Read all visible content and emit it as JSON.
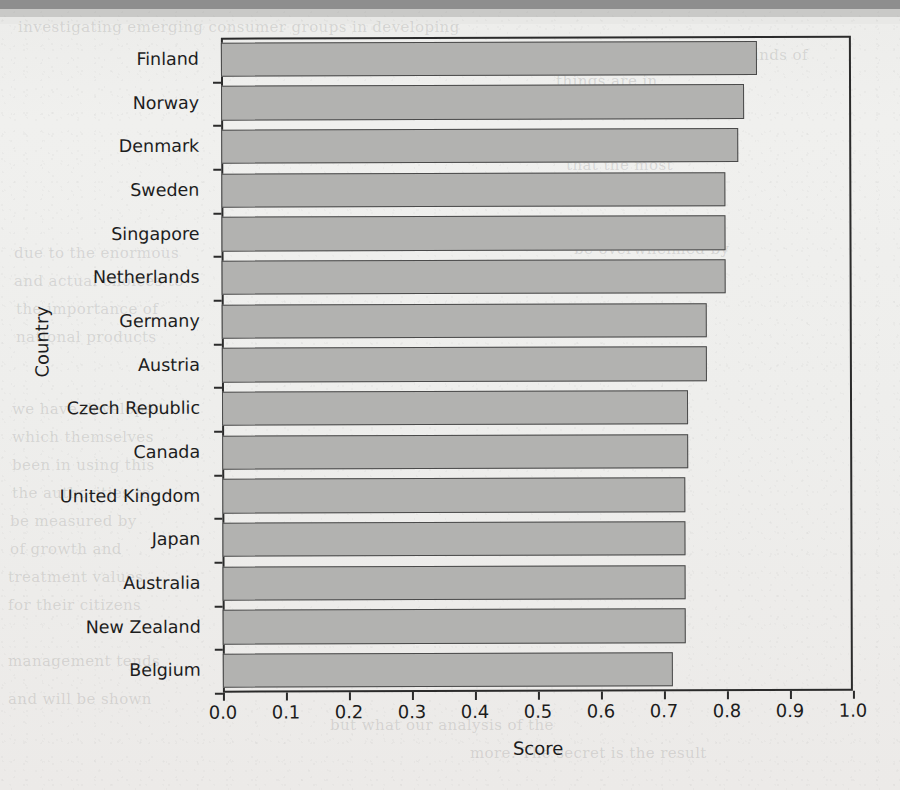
{
  "page": {
    "media": "scanned-book-page",
    "figure_type": "horizontal-bar-chart"
  },
  "chart_data": {
    "type": "bar",
    "orientation": "horizontal",
    "title": "",
    "xlabel": "Score",
    "ylabel": "Country",
    "xlim": [
      0.0,
      1.0
    ],
    "grid": false,
    "legend": null,
    "bar_fill_color": "#b2b2b0",
    "bar_edge_color": "#4a4a4a",
    "axis_color": "#2b2b2b",
    "xticks": [
      0.0,
      0.1,
      0.2,
      0.3,
      0.4,
      0.5,
      0.6,
      0.7,
      0.8,
      0.9,
      1.0
    ],
    "xtick_labels": [
      "0.0",
      "0.1",
      "0.2",
      "0.3",
      "0.4",
      "0.5",
      "0.6",
      "0.7",
      "0.8",
      "0.9",
      "1.0"
    ],
    "categories": [
      "Finland",
      "Norway",
      "Denmark",
      "Sweden",
      "Singapore",
      "Netherlands",
      "Germany",
      "Austria",
      "Czech Republic",
      "Canada",
      "United Kingdom",
      "Japan",
      "Australia",
      "New Zealand",
      "Belgium"
    ],
    "values": [
      0.85,
      0.83,
      0.82,
      0.8,
      0.8,
      0.8,
      0.77,
      0.77,
      0.74,
      0.74,
      0.735,
      0.735,
      0.735,
      0.735,
      0.715
    ]
  },
  "ghost_text": [
    {
      "text": "investigating emerging consumer groups in developing",
      "x": 18,
      "y": 18
    },
    {
      "text": "we want to know what kinds of",
      "x": 560,
      "y": 46
    },
    {
      "text": "things are in",
      "x": 556,
      "y": 72
    },
    {
      "text": "the deeper social",
      "x": 560,
      "y": 100
    },
    {
      "text": "ranking of countries",
      "x": 560,
      "y": 128
    },
    {
      "text": "that the most",
      "x": 566,
      "y": 156
    },
    {
      "text": "of the whole",
      "x": 570,
      "y": 184
    },
    {
      "text": "we want to see",
      "x": 574,
      "y": 212
    },
    {
      "text": "due to the enormous",
      "x": 14,
      "y": 244
    },
    {
      "text": "be overwhelmed by",
      "x": 574,
      "y": 240
    },
    {
      "text": "and actual choices to",
      "x": 14,
      "y": 272
    },
    {
      "text": "the importance of",
      "x": 16,
      "y": 300
    },
    {
      "text": "national products",
      "x": 16,
      "y": 328
    },
    {
      "text": "we have developed",
      "x": 12,
      "y": 400
    },
    {
      "text": "which themselves",
      "x": 12,
      "y": 428
    },
    {
      "text": "been in using this",
      "x": 12,
      "y": 456
    },
    {
      "text": "the authorities to",
      "x": 12,
      "y": 484
    },
    {
      "text": "be measured by",
      "x": 10,
      "y": 512
    },
    {
      "text": "of growth and",
      "x": 10,
      "y": 540
    },
    {
      "text": "treatment values",
      "x": 8,
      "y": 568
    },
    {
      "text": "for their citizens",
      "x": 8,
      "y": 596
    },
    {
      "text": "management tends",
      "x": 8,
      "y": 652
    },
    {
      "text": "and will be shown",
      "x": 8,
      "y": 690
    },
    {
      "text": "but what our analysis of the",
      "x": 330,
      "y": 716
    },
    {
      "text": "more. The secret is the result",
      "x": 470,
      "y": 744
    }
  ]
}
